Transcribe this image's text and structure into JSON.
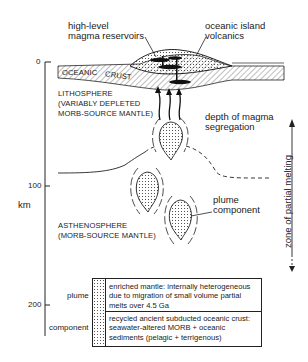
{
  "labels": {
    "reservoirs": [
      "high-level",
      "magma reservoirs"
    ],
    "volcanics": [
      "oceanic island",
      "volcanics"
    ],
    "oceanic": "OCEANIC",
    "crust": "CRUST",
    "lithosphere": [
      "LITHOSPHERE",
      "(VARIABLY DEPLETED",
      "MORB-SOURCE MANTLE)"
    ],
    "segregation": [
      "depth of magma",
      "segregation"
    ],
    "asthenosphere": [
      "ASTHENOSPHERE",
      "(MORB-SOURCE MANTLE)"
    ],
    "plume_component": [
      "plume",
      "component"
    ],
    "partial_melting": "zone of partial melting"
  },
  "axis": {
    "unit": "km",
    "ticks": [
      "0",
      "100",
      "200"
    ]
  },
  "legend": {
    "side_labels": [
      "plume",
      "component"
    ],
    "rows": [
      "enriched mantle: internally heterogeneous due to migration of small volume partial melts over 4.5 Ga",
      "recycled ancient subducted oceanic crust: seawater-altered MORB + oceanic sediments (pelagic + terrigenous)"
    ]
  }
}
